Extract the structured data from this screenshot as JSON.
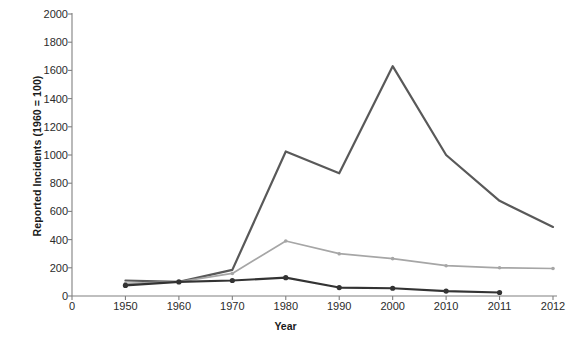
{
  "chart_data": {
    "type": "line",
    "title": "",
    "xlabel": "Year",
    "ylabel": "Reported Incidents (1960 = 100)",
    "categories": [
      "0",
      "1950",
      "1960",
      "1970",
      "1980",
      "1990",
      "2000",
      "2010",
      "2011",
      "2012"
    ],
    "x_tick_labels": [
      "0",
      "1950",
      "1960",
      "1970",
      "1980",
      "1990",
      "2000",
      "2010",
      "2011",
      "2012"
    ],
    "y_tick_labels": [
      "0",
      "200",
      "400",
      "600",
      "800",
      "1000",
      "1200",
      "1400",
      "1600",
      "1800",
      "2000"
    ],
    "y_ticks": [
      0,
      200,
      400,
      600,
      800,
      1000,
      1200,
      1400,
      1600,
      1800,
      2000
    ],
    "ylim": [
      0,
      2000
    ],
    "grid": false,
    "legend": "none",
    "series": [
      {
        "name": "series-dark-gray-upper",
        "color": "#595959",
        "x": [
          "1950",
          "1960",
          "1970",
          "1980",
          "1990",
          "2000",
          "2010",
          "2011",
          "2012"
        ],
        "values": [
          110,
          100,
          185,
          1025,
          870,
          1630,
          1000,
          675,
          490
        ],
        "markers": false
      },
      {
        "name": "series-light-gray-middle",
        "color": "#a6a6a6",
        "x": [
          "1950",
          "1960",
          "1970",
          "1980",
          "1990",
          "2000",
          "2010",
          "2011",
          "2012"
        ],
        "values": [
          90,
          100,
          160,
          390,
          300,
          265,
          215,
          200,
          195
        ],
        "markers": true
      },
      {
        "name": "series-black-lower",
        "color": "#333333",
        "x": [
          "1950",
          "1960",
          "1970",
          "1980",
          "1990",
          "2000",
          "2010",
          "2011"
        ],
        "values": [
          75,
          100,
          110,
          130,
          60,
          55,
          35,
          25
        ],
        "markers": true
      }
    ]
  },
  "axes": {
    "y_title": "Reported Incidents (1960 = 100)",
    "x_title": "Year"
  },
  "colors": {
    "axis": "#808080",
    "text": "#2b2b2b",
    "series_1": "#595959",
    "series_2": "#a6a6a6",
    "series_3": "#333333",
    "background": "#ffffff"
  }
}
